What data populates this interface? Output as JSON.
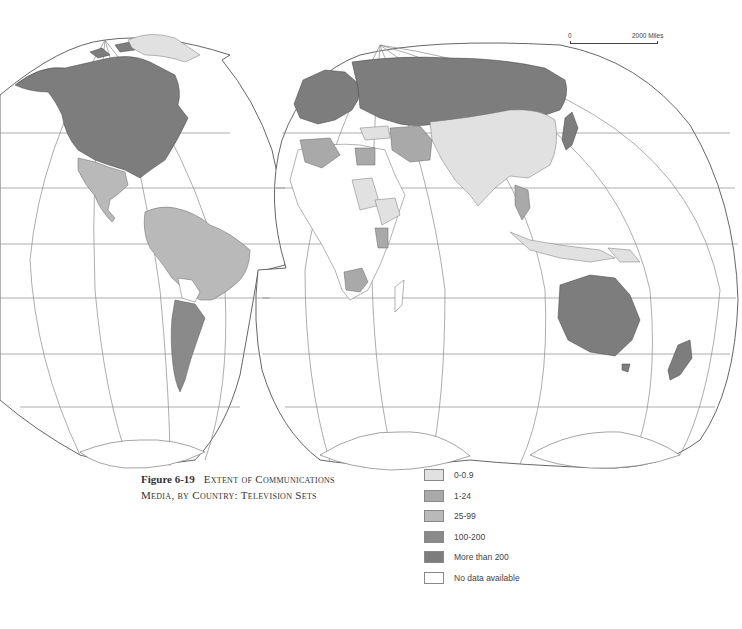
{
  "figure": {
    "number": "Figure 6-19",
    "title_line1": "Extent of Communications",
    "title_line2": "Media, by Country: Television Sets"
  },
  "scale_bar": {
    "start_label": "0",
    "end_label": "2000 Miles"
  },
  "legend": {
    "items": [
      {
        "label": "0-0.9",
        "color": "#e1e1e1"
      },
      {
        "label": "1-24",
        "color": "#a9a9a9"
      },
      {
        "label": "25-99",
        "color": "#b9b9b9"
      },
      {
        "label": "100-200",
        "color": "#8a8a8a"
      },
      {
        "label": "More than 200",
        "color": "#7d7d7d"
      },
      {
        "label": "No data available",
        "color": "#ffffff"
      }
    ]
  },
  "map": {
    "projection": "interrupted world projection (two lobes)",
    "regions": [
      {
        "name": "North America (USA, Canada)",
        "class": "More than 200"
      },
      {
        "name": "Greenland",
        "class": "0-0.9"
      },
      {
        "name": "Mexico & Central America",
        "class": "25-99"
      },
      {
        "name": "South America (Brazil, Andean states)",
        "class": "25-99"
      },
      {
        "name": "Argentina",
        "class": "100-200"
      },
      {
        "name": "Western Europe",
        "class": "More than 200"
      },
      {
        "name": "USSR",
        "class": "More than 200"
      },
      {
        "name": "North Africa (Algeria, Egypt)",
        "class": "1-24"
      },
      {
        "name": "Sub-Saharan Africa",
        "class": "No data available / 0-0.9"
      },
      {
        "name": "China, India, South Asia",
        "class": "0-0.9"
      },
      {
        "name": "Japan",
        "class": "More than 200"
      },
      {
        "name": "Australia",
        "class": "More than 200"
      },
      {
        "name": "New Zealand",
        "class": "More than 200"
      },
      {
        "name": "Indonesia, Papua New Guinea",
        "class": "0-0.9"
      }
    ]
  }
}
